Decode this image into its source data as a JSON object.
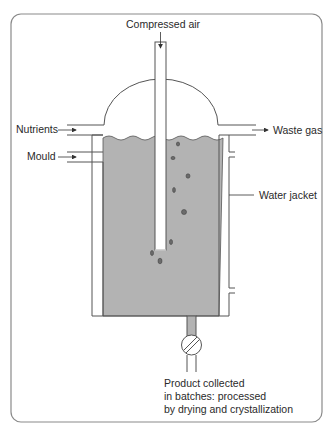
{
  "diagram": {
    "labels": {
      "compressed_air": "Compressed air",
      "nutrients": "Nutrients",
      "mould": "Mould",
      "waste_gas": "Waste gas",
      "water_jacket": "Water jacket",
      "product_line1": "Product collected",
      "product_line2": "in batches: processed",
      "product_line3": "by drying and crystallization"
    },
    "colors": {
      "frame": "#8a8a8a",
      "line": "#555555",
      "liquid": "#b3b3b3",
      "bubble": "#666666",
      "background": "#ffffff"
    }
  }
}
